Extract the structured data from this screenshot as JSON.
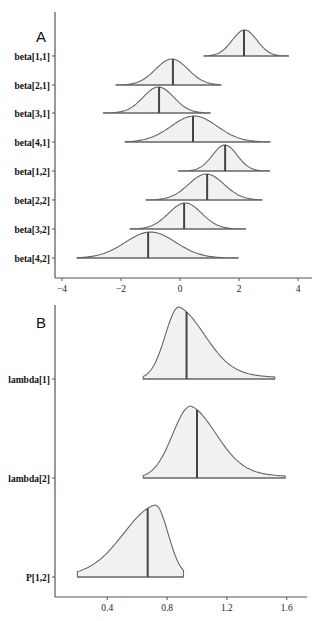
{
  "chart_data": [
    {
      "panel": "A",
      "type": "area",
      "subtype": "posterior-density-ridges",
      "title": "A",
      "xlabel": "",
      "ylabel": "",
      "xlim": [
        -4.25,
        4.25
      ],
      "xticks": [
        -4,
        -2,
        0,
        2,
        4
      ],
      "xtick_labels": [
        "−4",
        "−2",
        "0",
        "2",
        "4"
      ],
      "grid": false,
      "legend": null,
      "categories": [
        "beta[1,1]",
        "beta[2,1]",
        "beta[3,1]",
        "beta[4,1]",
        "beta[1,2]",
        "beta[2,2]",
        "beta[3,2]",
        "beta[4,2]"
      ],
      "series": [
        {
          "name": "beta[1,1]",
          "min": 0.81,
          "max": 3.69,
          "median": 2.17,
          "sd": 0.42,
          "skew": 0
        },
        {
          "name": "beta[2,1]",
          "min": -2.17,
          "max": 1.39,
          "median": -0.24,
          "sd": 0.55,
          "skew": 0
        },
        {
          "name": "beta[3,1]",
          "min": -2.61,
          "max": 1.02,
          "median": -0.71,
          "sd": 0.52,
          "skew": 0
        },
        {
          "name": "beta[4,1]",
          "min": -1.86,
          "max": 3.05,
          "median": 0.44,
          "sd": 0.78,
          "skew": 0
        },
        {
          "name": "beta[1,2]",
          "min": -0.07,
          "max": 3.05,
          "median": 1.53,
          "sd": 0.42,
          "skew": 0
        },
        {
          "name": "beta[2,2]",
          "min": -1.15,
          "max": 2.78,
          "median": 0.92,
          "sd": 0.6,
          "skew": 0
        },
        {
          "name": "beta[3,2]",
          "min": -1.69,
          "max": 2.24,
          "median": 0.14,
          "sd": 0.56,
          "skew": 0
        },
        {
          "name": "beta[4,2]",
          "min": -3.49,
          "max": 1.97,
          "median": -1.08,
          "sd": 0.85,
          "skew": 0
        }
      ]
    },
    {
      "panel": "B",
      "type": "area",
      "subtype": "posterior-density-ridges",
      "title": "B",
      "xlabel": "",
      "ylabel": "",
      "xlim": [
        0.05,
        1.75
      ],
      "xticks": [
        0.4,
        0.8,
        1.2,
        1.6
      ],
      "xtick_labels": [
        "0.4",
        "0.8",
        "1.2",
        "1.6"
      ],
      "grid": false,
      "legend": null,
      "categories": [
        "lambda[1]",
        "lambda[2]",
        "P[1,2]"
      ],
      "series": [
        {
          "name": "lambda[1]",
          "min": 0.64,
          "max": 1.52,
          "median": 0.93,
          "mode": 0.88,
          "skew": "right"
        },
        {
          "name": "lambda[2]",
          "min": 0.64,
          "max": 1.59,
          "median": 1.0,
          "mode": 0.96,
          "skew": "right"
        },
        {
          "name": "P[1,2]",
          "min": 0.2,
          "max": 0.91,
          "median": 0.67,
          "mode": 0.72,
          "skew": "left"
        }
      ]
    }
  ],
  "style": {
    "fill_color": "#f1f1f1",
    "outline_color": "#666666",
    "median_color": "#444444",
    "axis_color": "#555555"
  }
}
